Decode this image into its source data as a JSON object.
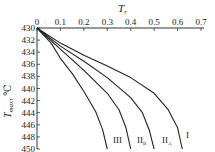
{
  "chart_data": {
    "type": "line",
    "title": "",
    "xlabel": "T_r",
    "ylabel": "T_max, ℃",
    "x_axis_position": "top",
    "y_axis_inverted": true,
    "xlim": [
      0,
      0.7
    ],
    "ylim": [
      430,
      450
    ],
    "xticks": [
      "0",
      "0.1",
      "0.2",
      "0.3",
      "0.4",
      "0.5",
      "0.6",
      "0.7"
    ],
    "yticks": [
      "430",
      "432",
      "434",
      "436",
      "438",
      "440",
      "442",
      "444",
      "446",
      "448",
      "450"
    ],
    "grid": false,
    "legend": "inline labels at curve ends",
    "series": [
      {
        "name": "I",
        "x": [
          0,
          0.1,
          0.2,
          0.3,
          0.4,
          0.5,
          0.56,
          0.6,
          0.62
        ],
        "y": [
          430,
          432.5,
          434.5,
          436.3,
          438.2,
          440.8,
          443.5,
          446.5,
          450
        ]
      },
      {
        "name": "II_A",
        "x": [
          0,
          0.1,
          0.2,
          0.3,
          0.4,
          0.45,
          0.48,
          0.5
        ],
        "y": [
          430,
          433,
          435.5,
          438.2,
          441.5,
          444,
          447,
          450
        ]
      },
      {
        "name": "II_B",
        "x": [
          0,
          0.1,
          0.2,
          0.3,
          0.35,
          0.38,
          0.4
        ],
        "y": [
          430,
          433.5,
          437,
          440.8,
          443.5,
          446.5,
          450
        ]
      },
      {
        "name": "III",
        "x": [
          0,
          0.06,
          0.1,
          0.15,
          0.2,
          0.25,
          0.28,
          0.3
        ],
        "y": [
          430,
          432.5,
          435,
          437.5,
          440.5,
          443.8,
          446.8,
          450
        ]
      }
    ]
  },
  "labels": {
    "xlabel_main": "T",
    "xlabel_sub": "r",
    "ylabel_main": "T",
    "ylabel_sub": "max",
    "ylabel_unit": ", ℃",
    "curve_I": "I",
    "curve_IIA_main": "II",
    "curve_IIA_sub": "A",
    "curve_IIB_main": "II",
    "curve_IIB_sub": "B",
    "curve_III": "III"
  }
}
